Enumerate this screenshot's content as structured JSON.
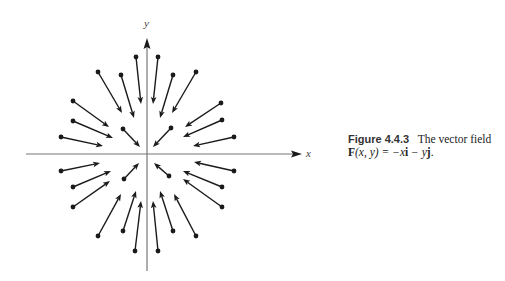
{
  "figure": {
    "number": "Figure 4.4.3",
    "title": "The vector field",
    "formula": "F(x, y) = −xi − yj.",
    "formula_parts": {
      "F": "F",
      "args": "(x, y) = −x",
      "i": "i",
      "minus_y": " − y",
      "j": "j",
      "end": "."
    }
  },
  "axes": {
    "x_label": "x",
    "y_label": "y",
    "origin": [
      147,
      154
    ],
    "x_range_px": [
      26,
      301
    ],
    "y_range_px": [
      38,
      271
    ]
  },
  "chart_data": {
    "type": "vector-field",
    "xlabel": "x",
    "ylabel": "y",
    "field": "F(x,y) = (-x, -y)",
    "note": "Arrows point toward the origin; each vector starts at a dot (base point) and points inward.",
    "vectors_px": [
      {
        "from": [
          136,
          57
        ],
        "to": [
          141,
          104
        ]
      },
      {
        "from": [
          121,
          75
        ],
        "to": [
          134,
          118
        ]
      },
      {
        "from": [
          98,
          72
        ],
        "to": [
          122,
          113
        ]
      },
      {
        "from": [
          73,
          101
        ],
        "to": [
          109,
          127
        ]
      },
      {
        "from": [
          73,
          121
        ],
        "to": [
          113,
          138
        ]
      },
      {
        "from": [
          61,
          137
        ],
        "to": [
          103,
          146
        ]
      },
      {
        "from": [
          123,
          129
        ],
        "to": [
          140,
          147
        ]
      },
      {
        "from": [
          158,
          57
        ],
        "to": [
          153,
          104
        ]
      },
      {
        "from": [
          173,
          75
        ],
        "to": [
          160,
          118
        ]
      },
      {
        "from": [
          196,
          72
        ],
        "to": [
          172,
          113
        ]
      },
      {
        "from": [
          221,
          103
        ],
        "to": [
          185,
          127
        ]
      },
      {
        "from": [
          222,
          120
        ],
        "to": [
          183,
          137
        ]
      },
      {
        "from": [
          234,
          137
        ],
        "to": [
          193,
          146
        ]
      },
      {
        "from": [
          171,
          128
        ],
        "to": [
          153,
          147
        ]
      },
      {
        "from": [
          61,
          171
        ],
        "to": [
          100,
          163
        ]
      },
      {
        "from": [
          73,
          187
        ],
        "to": [
          111,
          171
        ]
      },
      {
        "from": [
          73,
          207
        ],
        "to": [
          110,
          181
        ]
      },
      {
        "from": [
          98,
          236
        ],
        "to": [
          121,
          194
        ]
      },
      {
        "from": [
          123,
          231
        ],
        "to": [
          136,
          191
        ]
      },
      {
        "from": [
          135,
          251
        ],
        "to": [
          141,
          201
        ]
      },
      {
        "from": [
          124,
          179
        ],
        "to": [
          139,
          163
        ]
      },
      {
        "from": [
          234,
          171
        ],
        "to": [
          194,
          162
        ]
      },
      {
        "from": [
          222,
          187
        ],
        "to": [
          183,
          171
        ]
      },
      {
        "from": [
          222,
          207
        ],
        "to": [
          183,
          179
        ]
      },
      {
        "from": [
          196,
          236
        ],
        "to": [
          174,
          194
        ]
      },
      {
        "from": [
          173,
          231
        ],
        "to": [
          160,
          191
        ]
      },
      {
        "from": [
          158,
          251
        ],
        "to": [
          153,
          201
        ]
      },
      {
        "from": [
          169,
          176
        ],
        "to": [
          154,
          163
        ]
      }
    ]
  }
}
